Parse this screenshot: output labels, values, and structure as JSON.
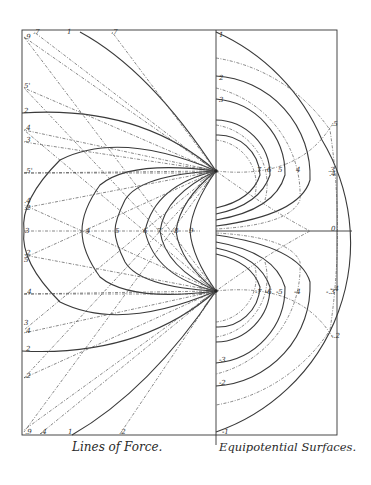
{
  "captions": {
    "left": "Lines of Force.",
    "right": "Equipotential Surfaces."
  },
  "geometry": {
    "frame": {
      "left": 22,
      "top": 30,
      "right": 337,
      "bottom": 435
    },
    "divider_x": 216,
    "axis_y": 231,
    "axis_end_x": 352,
    "charges": [
      {
        "name": "upper-charge",
        "x": 216,
        "y": 171
      },
      {
        "name": "lower-charge",
        "x": 216,
        "y": 291
      }
    ]
  },
  "left_panel": {
    "midline_labels": [
      {
        "text": "3",
        "x": 25,
        "y": 233
      },
      {
        "text": "4",
        "x": 86,
        "y": 233
      },
      {
        "text": "5",
        "x": 115,
        "y": 233
      },
      {
        "text": "6",
        "x": 143,
        "y": 233
      },
      {
        "text": "7",
        "x": 157,
        "y": 233
      },
      {
        "text": "8",
        "x": 174,
        "y": 233
      },
      {
        "text": "9",
        "x": 189,
        "y": 233
      }
    ],
    "edge_labels": [
      {
        "text": ".9",
        "x": 24,
        "y": 39
      },
      {
        "text": ".7",
        "x": 33,
        "y": 34
      },
      {
        "text": "1",
        "x": 67,
        "y": 34
      },
      {
        "text": ".7",
        "x": 111,
        "y": 34
      },
      {
        "text": "5'",
        "x": 24,
        "y": 88
      },
      {
        "text": "2",
        "x": 24,
        "y": 113
      },
      {
        "text": ".4",
        "x": 24,
        "y": 130
      },
      {
        "text": ".3",
        "x": 24,
        "y": 142
      },
      {
        "text": ".5'",
        "x": 24,
        "y": 173
      },
      {
        "text": ".4",
        "x": 24,
        "y": 203
      },
      {
        "text": ".2",
        "x": 24,
        "y": 210
      },
      {
        "text": ".2",
        "x": 24,
        "y": 255
      },
      {
        "text": "5",
        "x": 24,
        "y": 262
      },
      {
        "text": ".4",
        "x": 25,
        "y": 294
      },
      {
        "text": "3",
        "x": 24,
        "y": 325
      },
      {
        "text": ".4",
        "x": 24,
        "y": 333
      },
      {
        "text": "2",
        "x": 26,
        "y": 351
      },
      {
        "text": ".2",
        "x": 24,
        "y": 378
      },
      {
        "text": ".9",
        "x": 25,
        "y": 434
      },
      {
        "text": ".4",
        "x": 40,
        "y": 434
      },
      {
        "text": "1",
        "x": 68,
        "y": 434
      },
      {
        "text": ".2",
        "x": 119,
        "y": 434
      }
    ]
  },
  "right_panel": {
    "left_labels": [
      {
        "text": "1",
        "x": 219,
        "y": 37
      },
      {
        "text": "2",
        "x": 219,
        "y": 80
      },
      {
        "text": "3",
        "x": 219,
        "y": 102
      },
      {
        "text": "-3",
        "x": 219,
        "y": 362
      },
      {
        "text": "-2",
        "x": 219,
        "y": 385
      },
      {
        "text": "-1",
        "x": 222,
        "y": 434
      }
    ],
    "upper_labels": [
      {
        "text": "7",
        "x": 257,
        "y": 172
      },
      {
        "text": "6",
        "x": 267,
        "y": 172
      },
      {
        "text": "5",
        "x": 278,
        "y": 172
      },
      {
        "text": "4",
        "x": 296,
        "y": 172
      },
      {
        "text": ".3",
        "x": 328,
        "y": 172
      }
    ],
    "lower_labels": [
      {
        "text": "-7",
        "x": 255,
        "y": 294
      },
      {
        "text": "-6",
        "x": 265,
        "y": 294
      },
      {
        "text": "-5",
        "x": 276,
        "y": 294
      },
      {
        "text": "-4",
        "x": 294,
        "y": 294
      },
      {
        "text": "-.3",
        "x": 326,
        "y": 294
      }
    ],
    "edge_labels": [
      {
        "text": ".5",
        "x": 331,
        "y": 126
      },
      {
        "text": ".4",
        "x": 329,
        "y": 176
      },
      {
        "text": "0",
        "x": 331,
        "y": 231
      },
      {
        "text": "-.4",
        "x": 330,
        "y": 291
      },
      {
        "text": "-.2",
        "x": 331,
        "y": 338
      }
    ]
  }
}
